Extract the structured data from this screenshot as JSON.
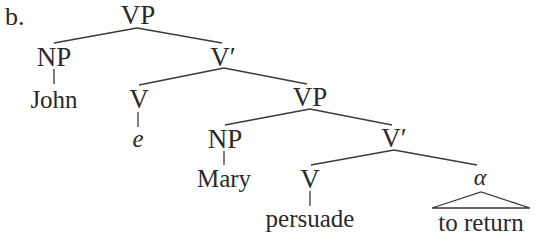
{
  "example_label": "b.",
  "tree": {
    "root": "VP",
    "nodes": {
      "vp_root": "VP",
      "np_subject": "NP",
      "subject_word": "John",
      "vbar_1": "V′",
      "v_empty": "V",
      "v_empty_word": "e",
      "vp_inner": "VP",
      "np_object": "NP",
      "object_word": "Mary",
      "vbar_2": "V′",
      "v_main": "V",
      "v_main_word": "persuade",
      "alpha": "α",
      "alpha_word": "to return"
    },
    "structure": "[VP [NP John] [V′ [V e] [VP [NP Mary] [V′ [V persuade] [α to return]]]]]"
  },
  "colors": {
    "text": "#2a2a2a",
    "lines": "#3a3a3a",
    "background": "#ffffff"
  }
}
